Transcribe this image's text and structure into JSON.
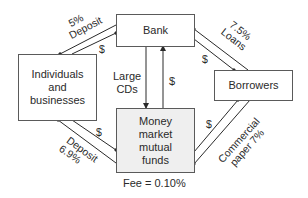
{
  "nodes": {
    "bank": "Bank",
    "individuals": [
      "Individuals",
      "and",
      "businesses"
    ],
    "borrowers": "Borrowers",
    "fund": [
      "Money",
      "market",
      "mutual",
      "funds"
    ]
  },
  "edges": {
    "individuals_bank": {
      "rate": "5%",
      "label": "Deposit",
      "money": "$"
    },
    "bank_borrowers": {
      "rate": "7.5%",
      "label": "Loans",
      "money": "$"
    },
    "bank_fund": {
      "label_line1": "Large",
      "label_line2": "CDs",
      "money": "$"
    },
    "individuals_fund": {
      "label": "Deposit",
      "rate": "6.9%",
      "money": "$"
    },
    "fund_borrowers": {
      "label_line1": "Commercial",
      "label_line2": "paper 7%",
      "money": "$"
    }
  },
  "fee": "Fee = 0.10%",
  "colors": {
    "line": "#2a2a2a",
    "border": "#5a5a5a",
    "fund_fill": "#efefef"
  }
}
